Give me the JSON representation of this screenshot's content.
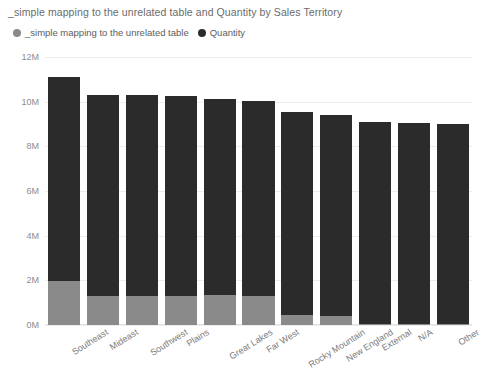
{
  "chart_data": {
    "type": "bar",
    "subtype": "stacked-bar",
    "title": "_simple mapping to the unrelated table and Quantity by Sales Territory",
    "xlabel": "Sales Territory",
    "ylabel": "",
    "ylim": [
      0,
      12000000
    ],
    "ytick_labels": [
      "0M",
      "2M",
      "4M",
      "6M",
      "8M",
      "10M",
      "12M"
    ],
    "ytick_values": [
      0,
      2000000,
      4000000,
      6000000,
      8000000,
      10000000,
      12000000
    ],
    "grid": true,
    "legend_position": "top-left",
    "categories": [
      "Southeast",
      "Mideast",
      "Southwest",
      "Plains",
      "Great Lakes",
      "Far West",
      "Rocky Mountain",
      "New England",
      "External",
      "N/A",
      "Other"
    ],
    "series": [
      {
        "name": "_simple mapping to the unrelated table",
        "color": "#8a8a8a",
        "values": [
          1950000,
          1300000,
          1300000,
          1300000,
          1350000,
          1300000,
          450000,
          400000,
          50000,
          30000,
          30000
        ]
      },
      {
        "name": "Quantity",
        "color": "#2b2b2b",
        "values": [
          9150000,
          9000000,
          9000000,
          8950000,
          8750000,
          8750000,
          9100000,
          9000000,
          9050000,
          9020000,
          8970000
        ]
      }
    ],
    "totals": [
      11100000,
      10300000,
      10300000,
      10250000,
      10100000,
      10050000,
      9550000,
      9400000,
      9100000,
      9050000,
      9000000
    ]
  },
  "legend": {
    "items": [
      {
        "label": "_simple mapping to the unrelated table",
        "color": "#8a8a8a"
      },
      {
        "label": "Quantity",
        "color": "#2b2b2b"
      }
    ]
  }
}
